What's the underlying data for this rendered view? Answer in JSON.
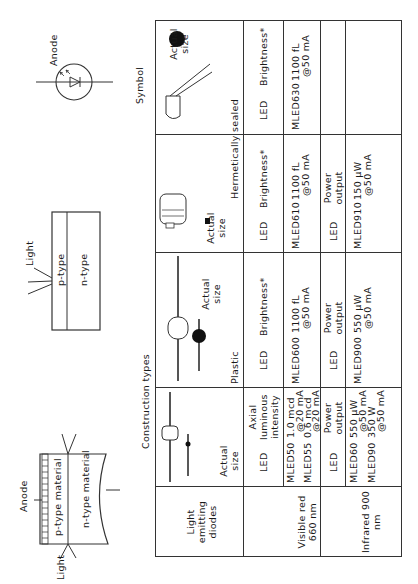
{
  "diagrams": {
    "cross_section": {
      "anode_label": "Anode",
      "p_label": "p-type material",
      "n_label": "n-type material",
      "light_label": "Light"
    },
    "planar": {
      "p_label": "p-type",
      "n_label": "n-type",
      "light_label": "Light"
    },
    "symbol": {
      "anode_label": "Anode",
      "title": "Symbol"
    }
  },
  "table": {
    "title": "Construction types",
    "row_header": "Light emitting diodes",
    "groups": {
      "plastic": "Plastic",
      "hermetic": "Hermetically sealed"
    },
    "actual_size": "Actual size",
    "columns": [
      {
        "led": "LED",
        "metric": "Axial luminous intensity"
      },
      {
        "led": "LED",
        "metric": "Brightness*"
      },
      {
        "led": "LED",
        "metric": "Brightness*"
      },
      {
        "led": "LED",
        "metric": "Brightness*"
      }
    ],
    "rows": [
      {
        "label": "Visible red 660 nm",
        "cells": [
          {
            "parts": [
              {
                "name": "MLED50",
                "value": "1.0 mcd",
                "cond": "@20 mA"
              },
              {
                "name": "MLED55",
                "value": "0.6 mcd",
                "cond": "@20 mA"
              }
            ]
          },
          {
            "parts": [
              {
                "name": "MLED600",
                "value": "1100 fL",
                "cond": "@50 mA"
              }
            ]
          },
          {
            "parts": [
              {
                "name": "MLED610",
                "value": "1100 fL",
                "cond": "@50 mA"
              }
            ]
          },
          {
            "parts": [
              {
                "name": "MLED630",
                "value": "1100 fL",
                "cond": "@50 mA"
              }
            ]
          }
        ]
      },
      {
        "label": "Infrared 900 nm",
        "subheaders": [
          {
            "led": "LED",
            "metric": "Power output"
          },
          {
            "led": "LED",
            "metric": "Power output"
          },
          {
            "led": "LED",
            "metric": "Power output"
          },
          {
            "led": "",
            "metric": ""
          }
        ],
        "cells": [
          {
            "parts": [
              {
                "name": "MLED60",
                "value": "550 μW",
                "cond": "@50 mA"
              },
              {
                "name": "MLED90",
                "value": "350 W",
                "cond": "@50 mA"
              }
            ]
          },
          {
            "parts": [
              {
                "name": "MLED900",
                "value": "550 μW",
                "cond": "@50 mA"
              }
            ]
          },
          {
            "parts": [
              {
                "name": "MLED910",
                "value": "150 μW",
                "cond": "@50 mA"
              }
            ]
          },
          {
            "parts": []
          }
        ]
      }
    ]
  }
}
